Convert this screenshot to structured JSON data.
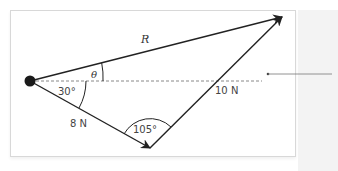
{
  "diagram": {
    "labels": {
      "resultant": "R",
      "angle_theta": "θ",
      "angle_30": "30°",
      "force_a": "8 N",
      "force_b": "10 N",
      "angle_105": "105°"
    },
    "geometry": {
      "origin": [
        30,
        81
      ],
      "force_a_tip": [
        150,
        148
      ],
      "resultant_tip": [
        282,
        17
      ],
      "reference_line_end": 262,
      "leader_start": [
        268,
        74
      ],
      "leader_end": [
        332,
        74
      ]
    },
    "colors": {
      "stroke": "#222222",
      "dashed": "#888888",
      "frame": "#d8d8d8",
      "label": "#333333"
    }
  }
}
